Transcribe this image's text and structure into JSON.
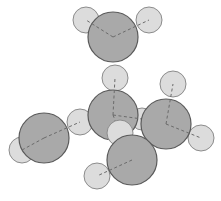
{
  "diagram": {
    "title": "",
    "type": "space-filling molecular model",
    "colors": {
      "heavy_atom_fill": "#a9a9a9",
      "heavy_atom_stroke": "#5a5a5a",
      "light_atom_fill": "#dcdcdc",
      "light_atom_stroke": "#8c8c8c",
      "bond_dash": "#6b6b6b",
      "background": "#ffffff"
    },
    "atoms": [
      {
        "id": "h1",
        "kind": "light",
        "bonded_to": "c1"
      },
      {
        "id": "h2",
        "kind": "light",
        "bonded_to": "c1"
      },
      {
        "id": "c1",
        "kind": "heavy"
      },
      {
        "id": "h3",
        "kind": "light",
        "bonded_to": "c2"
      },
      {
        "id": "h4",
        "kind": "light",
        "bonded_to": "c4"
      },
      {
        "id": "h5",
        "kind": "light",
        "bonded_to": "c4"
      },
      {
        "id": "c4",
        "kind": "heavy"
      },
      {
        "id": "h6",
        "kind": "light",
        "bonded_to": "c3"
      },
      {
        "id": "h7",
        "kind": "light",
        "bonded_to": "c3"
      },
      {
        "id": "h8",
        "kind": "light",
        "bonded_to": "c2"
      },
      {
        "id": "c2",
        "kind": "heavy"
      },
      {
        "id": "c3",
        "kind": "heavy"
      },
      {
        "id": "h9",
        "kind": "light",
        "bonded_to": "c2"
      },
      {
        "id": "h10",
        "kind": "light",
        "bonded_to": "c5"
      },
      {
        "id": "c5",
        "kind": "heavy"
      }
    ],
    "heavy_atom_count": 5,
    "light_atom_count": 10
  }
}
